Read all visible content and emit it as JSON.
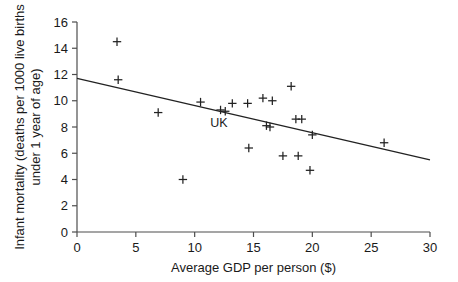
{
  "chart_data": {
    "type": "scatter",
    "title": "",
    "xlabel": "Average GDP per person ($)",
    "ylabel": "Infant mortality (deaths per 1000 live births under 1 year of age)",
    "ylabel_line1": "Infant mortality (deaths per 1000 live births",
    "ylabel_line2": "under 1 year of age)",
    "xlim": [
      0,
      30
    ],
    "ylim": [
      0,
      16
    ],
    "xticks": [
      0,
      5,
      10,
      15,
      20,
      25,
      30
    ],
    "xtick_labels": [
      "0",
      "5",
      "10",
      "15",
      "20",
      "25",
      "30"
    ],
    "yticks": [
      0,
      2,
      4,
      6,
      8,
      10,
      12,
      14,
      16
    ],
    "ytick_labels": [
      "0",
      "2",
      "4",
      "6",
      "8",
      "10",
      "12",
      "14",
      "16"
    ],
    "grid": false,
    "legend": null,
    "marker": "plus",
    "marker_color": "#222222",
    "axis_color": "#4d4d4d",
    "points": [
      {
        "x": 3.4,
        "y": 14.5
      },
      {
        "x": 3.5,
        "y": 11.6
      },
      {
        "x": 6.9,
        "y": 9.1
      },
      {
        "x": 9.0,
        "y": 4.0
      },
      {
        "x": 10.5,
        "y": 9.9
      },
      {
        "x": 12.2,
        "y": 9.3
      },
      {
        "x": 12.6,
        "y": 9.2
      },
      {
        "x": 13.2,
        "y": 9.8
      },
      {
        "x": 14.5,
        "y": 9.8
      },
      {
        "x": 14.6,
        "y": 6.4
      },
      {
        "x": 15.8,
        "y": 10.2
      },
      {
        "x": 16.1,
        "y": 8.1
      },
      {
        "x": 16.4,
        "y": 8.0
      },
      {
        "x": 16.6,
        "y": 10.0
      },
      {
        "x": 17.5,
        "y": 5.8
      },
      {
        "x": 18.2,
        "y": 11.1
      },
      {
        "x": 18.6,
        "y": 8.6
      },
      {
        "x": 18.8,
        "y": 5.8
      },
      {
        "x": 19.1,
        "y": 8.6
      },
      {
        "x": 19.8,
        "y": 4.7
      },
      {
        "x": 20.0,
        "y": 7.4
      },
      {
        "x": 26.1,
        "y": 6.8
      }
    ],
    "annotations": [
      {
        "label": "UK",
        "x": 12.4,
        "y": 9.25,
        "dx": -4,
        "dy": 16
      }
    ],
    "trend_line": {
      "x_start": 0,
      "y_start": 11.7,
      "x_end": 30,
      "y_end": 5.5
    }
  }
}
